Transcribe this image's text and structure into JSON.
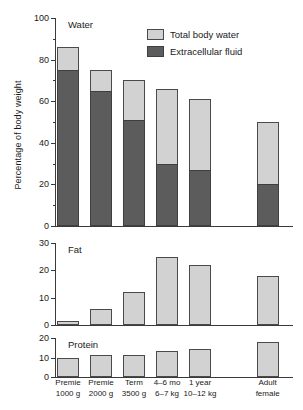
{
  "chart_data": {
    "type": "bar",
    "title": "",
    "xlabel": "",
    "ylabel": "Percentage of body weight",
    "grid": false,
    "legend_position": "top-right",
    "legend": [
      {
        "key": "total_body_water",
        "label": "Total body water",
        "color": "#d2d2d2"
      },
      {
        "key": "extracellular_fluid",
        "label": "Extracellular fluid",
        "color": "#5c5c5c"
      }
    ],
    "categories": [
      {
        "line1": "Premie",
        "line2": "1000 g"
      },
      {
        "line1": "Premie",
        "line2": "2000 g"
      },
      {
        "line1": "Term",
        "line2": "3500 g"
      },
      {
        "line1": "4–6 mo",
        "line2": "6–7 kg"
      },
      {
        "line1": "1 year",
        "line2": "10–12 kg"
      },
      {
        "line1": "Adult",
        "line2": "female"
      }
    ],
    "panels": [
      {
        "name": "Water",
        "ylim": [
          0,
          100
        ],
        "yticks": [
          0,
          20,
          40,
          60,
          80,
          100
        ],
        "yticks_minor": [
          10,
          30,
          50,
          70,
          90
        ],
        "stacked": true,
        "series": [
          {
            "name": "Total body water",
            "values": [
              86,
              75,
              70,
              66,
              61,
              50
            ]
          },
          {
            "name": "Extracellular fluid",
            "values": [
              75,
              65,
              51,
              30,
              27,
              20
            ]
          }
        ]
      },
      {
        "name": "Fat",
        "ylim": [
          0,
          30
        ],
        "yticks": [
          0,
          10,
          20,
          30
        ],
        "yticks_minor": [],
        "stacked": false,
        "series": [
          {
            "name": "Fat",
            "values": [
              1.5,
              6,
              12,
              25,
              22,
              18
            ]
          }
        ]
      },
      {
        "name": "Protein",
        "ylim": [
          0,
          20
        ],
        "yticks": [
          0,
          10,
          20
        ],
        "yticks_minor": [],
        "stacked": false,
        "series": [
          {
            "name": "Protein",
            "values": [
              9.5,
              11.5,
              11.5,
              13.5,
              14.5,
              18
            ]
          }
        ]
      }
    ]
  }
}
